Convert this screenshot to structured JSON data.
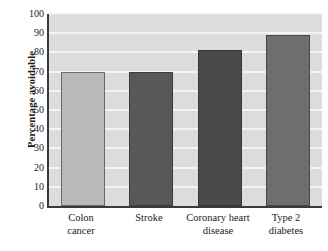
{
  "chart_data": {
    "type": "bar",
    "title": "",
    "xlabel": "",
    "ylabel": "Percentage avoidable",
    "categories": [
      "Colon cancer",
      "Stroke",
      "Coronary heart disease",
      "Type 2 diabetes"
    ],
    "category_lines": [
      [
        "Colon",
        "cancer"
      ],
      [
        "Stroke",
        ""
      ],
      [
        "Coronary heart",
        "disease"
      ],
      [
        "Type 2",
        "diabetes"
      ]
    ],
    "values": [
      70,
      70,
      81,
      89
    ],
    "ylim": [
      0,
      100
    ],
    "ytick_step": 10,
    "yticks": [
      "100",
      "90",
      "80",
      "70",
      "60",
      "50",
      "40",
      "30",
      "20",
      "10",
      "0"
    ],
    "grid": true,
    "legend": "none",
    "bar_colors": [
      "#b9b9b9",
      "#585858",
      "#4a4a4a",
      "#6e6e6e"
    ],
    "plot_background": "#dcdcdc",
    "gridline_color": "#f4f4f4",
    "axis_color": "#3a3a3a"
  }
}
